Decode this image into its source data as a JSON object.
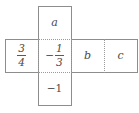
{
  "figure": {
    "kind": "cube-net-cross",
    "stroke_color": "#8d8d8d",
    "dotted_color": "#9a9a9a",
    "text_color": "#4a4a4a",
    "background": "#ffffff"
  },
  "cells": {
    "top": {
      "position": "top",
      "label": "a",
      "type": "variable"
    },
    "left": {
      "position": "middle-left",
      "type": "fraction",
      "sign": "",
      "numerator": "3",
      "denominator": "4",
      "label": "3/4"
    },
    "center": {
      "position": "middle-center",
      "type": "fraction",
      "sign": "−",
      "numerator": "1",
      "denominator": "3",
      "label": "−1/3"
    },
    "b": {
      "position": "middle-right-1",
      "label": "b",
      "type": "variable"
    },
    "c": {
      "position": "middle-right-2",
      "label": "c",
      "type": "variable"
    },
    "bottom": {
      "position": "bottom",
      "type": "integer",
      "label": "−1"
    }
  }
}
